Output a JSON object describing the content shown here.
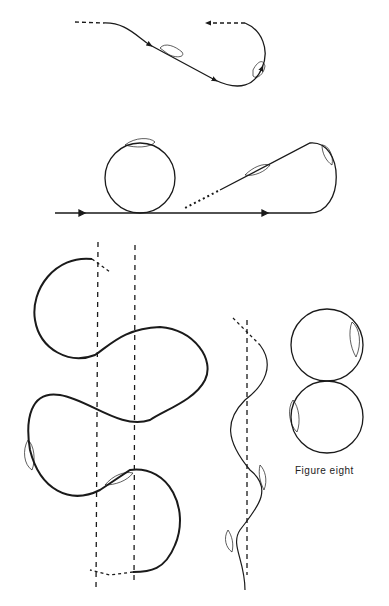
{
  "diagram": {
    "labels": {
      "figure_eight": "Figure eight"
    },
    "figures": [
      {
        "id": "s-turn-reversal",
        "description": "S-shaped path reversing direction"
      },
      {
        "id": "loop-and-teardrop",
        "description": "Straight line with circular loop and teardrop turn"
      },
      {
        "id": "s-turns-across-road",
        "description": "S-turns across parallel dashed reference lines"
      },
      {
        "id": "zigzag-wave",
        "description": "Wavy path along dashed line"
      },
      {
        "id": "figure-eight",
        "description": "Two tangent circles forming a figure eight"
      }
    ],
    "colors": {
      "line": "#1a1a1a",
      "background": "#ffffff"
    }
  }
}
